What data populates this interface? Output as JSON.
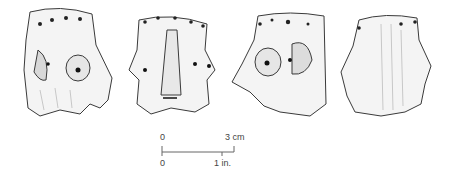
{
  "figure": {
    "views": [
      {
        "id": "view-1",
        "description": "three-quarter view, left side with eye"
      },
      {
        "id": "view-2",
        "description": "frontal view with nose"
      },
      {
        "id": "view-3",
        "description": "three-quarter view, right side with eye"
      },
      {
        "id": "view-4",
        "description": "rear view"
      }
    ],
    "scale_bar": {
      "metric_start": "0",
      "metric_end": "3 cm",
      "imperial_start": "0",
      "imperial_end": "1 in."
    }
  },
  "colors": {
    "line": "#3a3a3a",
    "shade": "#9a9a9a",
    "background": "#ffffff"
  }
}
